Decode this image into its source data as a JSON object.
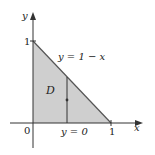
{
  "diagram": {
    "type": "region-plot",
    "axes": {
      "x_label": "x",
      "y_label": "y",
      "x_ticks": [
        "0",
        "1"
      ],
      "y_ticks": [
        "1"
      ]
    },
    "region": {
      "name": "D",
      "vertices": [
        [
          0,
          0
        ],
        [
          1,
          0
        ],
        [
          0,
          1
        ]
      ],
      "fill_color": "#cfcfcf"
    },
    "curves": {
      "top_boundary": "y = 1 − x",
      "bottom_boundary": "y = 0"
    },
    "vertical_segment": {
      "description": "vertical strip from y = 0 to y = 1 − x"
    },
    "colors": {
      "axis": "#333333",
      "boundary": "#555555",
      "fill": "#cfcfcf"
    }
  }
}
